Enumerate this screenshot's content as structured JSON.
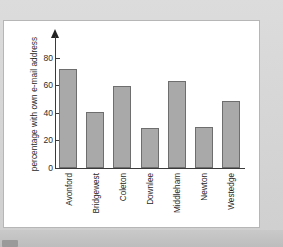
{
  "chart_data": {
    "type": "bar",
    "title": "",
    "xlabel": "",
    "ylabel": "percentage with own e-mail address",
    "categories": [
      "Avonford",
      "Bridgewest",
      "Coleton",
      "Downlee",
      "Middleham",
      "Newton",
      "Westedge"
    ],
    "values": [
      72,
      41,
      60,
      29,
      63,
      30,
      49
    ],
    "ylim": [
      0,
      88
    ],
    "yticks": [
      0,
      20,
      40,
      60,
      80
    ],
    "ytick_labels": [
      "0",
      "20",
      "40",
      "60",
      "80"
    ],
    "grid": false,
    "legend": null,
    "series": [
      {
        "name": "percentage with own e-mail address",
        "values": [
          72,
          41,
          60,
          29,
          63,
          30,
          49
        ]
      }
    ],
    "axis_arrow_top": true,
    "bar_color": "#a9a9a9",
    "bar_edge_color": "#6e6e6e",
    "axis_color": "#3a3a3a",
    "plot_background": "#ffffff",
    "page_background": "#d6d6d6"
  }
}
